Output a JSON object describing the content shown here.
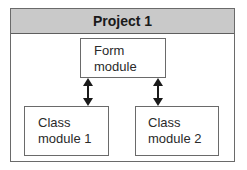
{
  "diagram": {
    "container": {
      "title": "Project 1",
      "header_fill": "#c9c9c9",
      "border_color": "#6a6a6a"
    },
    "nodes": [
      {
        "id": "form",
        "label": "Form\nmodule"
      },
      {
        "id": "class1",
        "label": "Class\nmodule 1"
      },
      {
        "id": "class2",
        "label": "Class\nmodule 2"
      }
    ],
    "edges": [
      {
        "from": "form",
        "to": "class1",
        "type": "bidirectional-arrow"
      },
      {
        "from": "form",
        "to": "class2",
        "type": "bidirectional-arrow"
      }
    ]
  }
}
